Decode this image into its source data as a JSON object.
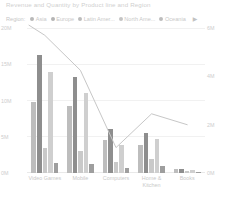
{
  "header": {
    "title": "Revenue and Quantity by Product line and Region"
  },
  "legend": {
    "label": "Region:",
    "more_icon": "chevron-right-icon",
    "items": [
      {
        "label": "Asia",
        "color": "#b9b9b9"
      },
      {
        "label": "Europe",
        "color": "#b4b4b4"
      },
      {
        "label": "Latin Amer...",
        "color": "#bcbcbc"
      },
      {
        "label": "North Ame...",
        "color": "#c4c4c4"
      },
      {
        "label": "Oceania",
        "color": "#bdbdbd"
      }
    ]
  },
  "chart_data": {
    "type": "bar",
    "title": "Revenue and Quantity by Product line and Region",
    "xlabel": "",
    "ylabel": "Revenue",
    "y2label": "Quantity",
    "ylim": [
      0,
      20000000
    ],
    "y2lim": [
      0,
      6000000
    ],
    "grid": true,
    "legend_position": "top",
    "yticks": [
      "0M",
      "5M",
      "10M",
      "15M",
      "20M"
    ],
    "y2ticks": [
      "0M",
      "2M",
      "4M",
      "6M"
    ],
    "categories": [
      "Video Games",
      "Mobile",
      "Computers",
      "Home & Kitchen",
      "Books"
    ],
    "series": [
      {
        "name": "Asia",
        "color": "#bdbdbd",
        "values": [
          9800000,
          9200000,
          4600000,
          3900000,
          500000
        ]
      },
      {
        "name": "Europe",
        "color": "#8e8e8e",
        "values": [
          16300000,
          13200000,
          6100000,
          5500000,
          600000
        ]
      },
      {
        "name": "Latin Amer...",
        "color": "#c9c9c9",
        "values": [
          3400000,
          3000000,
          1500000,
          1900000,
          300000
        ]
      },
      {
        "name": "North Ame...",
        "color": "#cfcfcf",
        "values": [
          13900000,
          11000000,
          3900000,
          4700000,
          450000
        ]
      },
      {
        "name": "Oceania",
        "color": "#9e9e9e",
        "values": [
          1400000,
          1200000,
          700000,
          900000,
          200000
        ]
      }
    ],
    "line_series": {
      "name": "Quantity",
      "color": "#c7c7c7",
      "axis": "y2",
      "values": [
        5700000,
        4250000,
        1050000,
        2450000,
        2000000
      ]
    }
  }
}
